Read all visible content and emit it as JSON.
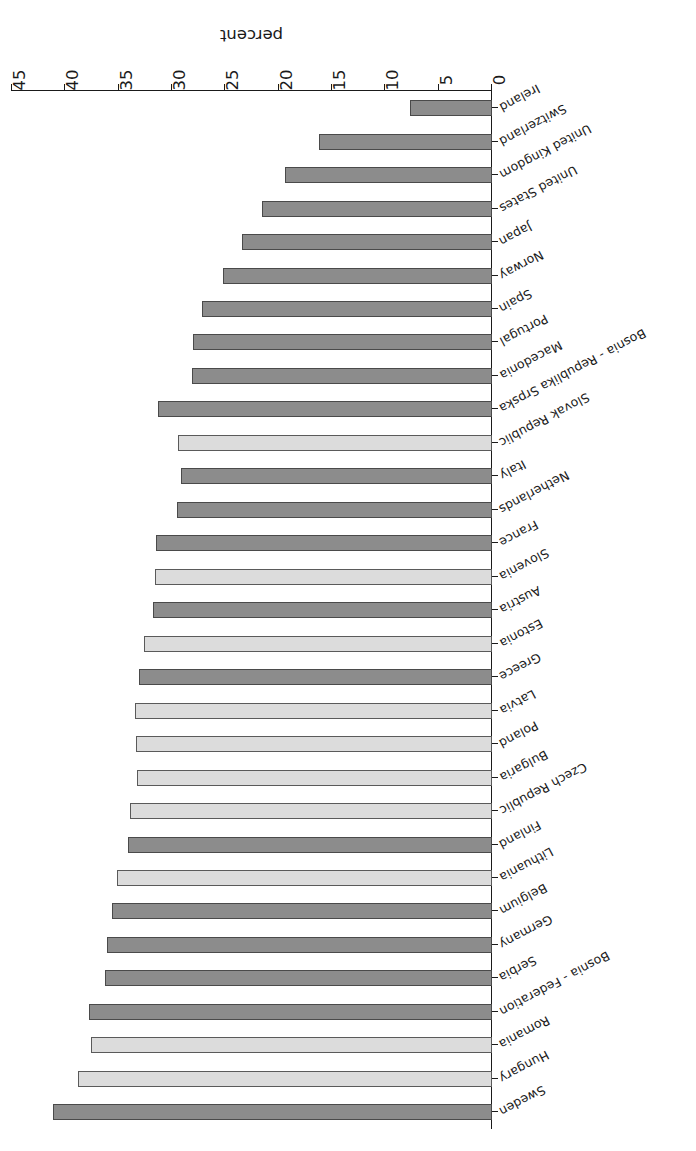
{
  "chart_data": {
    "type": "bar",
    "orientation": "horizontal",
    "title": "",
    "xlabel": "percent",
    "ylabel": "",
    "xlim": [
      0,
      45
    ],
    "xticks": [
      0,
      5,
      10,
      15,
      20,
      25,
      30,
      35,
      40,
      45
    ],
    "grid": false,
    "legend": "none",
    "rotated_180": true,
    "colors": {
      "bar_dark": "#8c8c8c",
      "bar_light": "#dcdcdc",
      "bar_border": "#4a4a4a",
      "axis": "#1a1a1a",
      "background": "#ffffff"
    },
    "categories": [
      "Sweden",
      "Hungary",
      "Romania",
      "Bosnia - Federation",
      "Serbia",
      "Germany",
      "Belgium",
      "Lithuania",
      "Finland",
      "Czech Republic",
      "Bulgaria",
      "Poland",
      "Latvia",
      "Greece",
      "Estonia",
      "Austria",
      "Slovenia",
      "France",
      "Netherlands",
      "Italy",
      "Slovak Republic",
      "Bosnia - Republika Srpska",
      "Macedonia",
      "Portugal",
      "Spain",
      "Norway",
      "Japan",
      "United States",
      "United Kingdom",
      "Switzerland",
      "Ireland"
    ],
    "values": [
      41.2,
      38.8,
      37.6,
      37.8,
      36.3,
      36.1,
      35.6,
      35.2,
      34.1,
      33.9,
      33.3,
      33.4,
      33.5,
      33.1,
      32.6,
      31.8,
      31.6,
      31.5,
      29.5,
      29.2,
      29.4,
      31.3,
      28.1,
      28.0,
      27.2,
      25.2,
      23.4,
      21.6,
      19.4,
      16.2,
      7.7
    ],
    "shades": [
      "dark",
      "light",
      "light",
      "dark",
      "dark",
      "dark",
      "dark",
      "light",
      "dark",
      "light",
      "light",
      "light",
      "light",
      "dark",
      "light",
      "dark",
      "light",
      "dark",
      "dark",
      "dark",
      "light",
      "dark",
      "dark",
      "dark",
      "dark",
      "dark",
      "dark",
      "dark",
      "dark",
      "dark",
      "dark"
    ]
  }
}
